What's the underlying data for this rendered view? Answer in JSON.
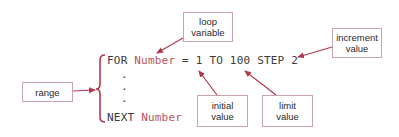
{
  "diagram": {
    "colors": {
      "arrow": "#b03a4a",
      "box_border": "#c9a3ab",
      "code_text": "#3a3a3a",
      "variable_text": "#b9525d",
      "brace": "#b03a4a"
    },
    "code": {
      "line1": {
        "keyword_for": "FOR",
        "variable": "Number",
        "equals": "=",
        "initial": "1",
        "keyword_to": "TO",
        "limit": "100",
        "keyword_step": "STEP",
        "increment": "2"
      },
      "dots": [
        ".",
        ".",
        "."
      ],
      "line_last": {
        "keyword_next": "NEXT",
        "variable": "Number"
      }
    },
    "labels": {
      "loop_variable": {
        "line1": "loop",
        "line2": "variable"
      },
      "increment_value": {
        "line1": "increment",
        "line2": "value"
      },
      "range": {
        "line1": "range"
      },
      "initial_value": {
        "line1": "initial",
        "line2": "value"
      },
      "limit_value": {
        "line1": "limit",
        "line2": "value"
      }
    }
  }
}
